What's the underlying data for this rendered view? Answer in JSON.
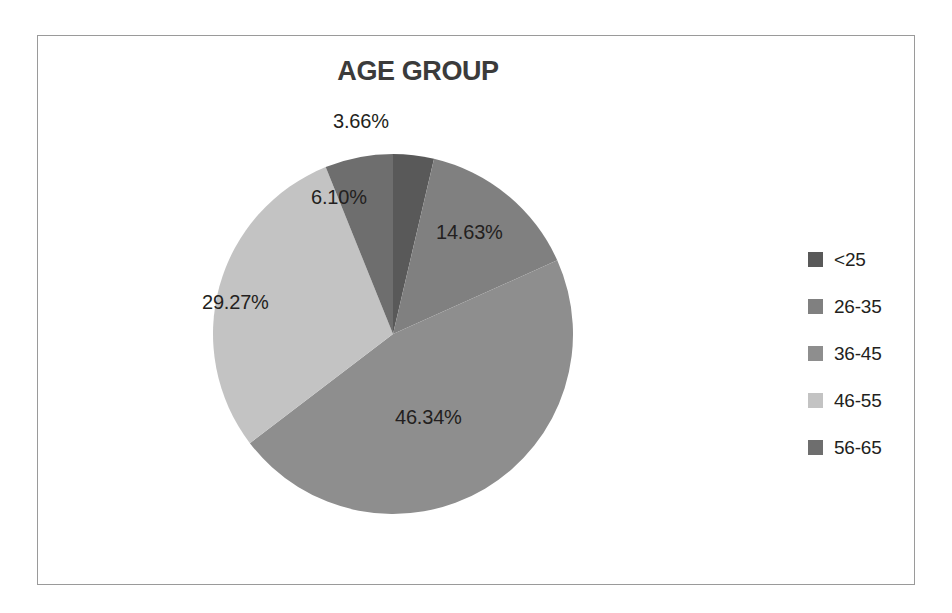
{
  "chart_data": {
    "type": "pie",
    "title": "AGE GROUP",
    "xlabel": "",
    "ylabel": "",
    "legend_position": "right",
    "grid": false,
    "categories": [
      "<25",
      "26-35",
      "36-45",
      "46-55",
      "56-65"
    ],
    "values": [
      3.66,
      14.63,
      46.34,
      29.27,
      6.1
    ],
    "value_labels": [
      "3.66%",
      "14.63%",
      "46.34%",
      "29.27%",
      "6.10%"
    ],
    "colors": [
      "#595959",
      "#808080",
      "#8e8e8e",
      "#c3c3c3",
      "#6e6e6e"
    ],
    "start_angle_deg": 0,
    "direction": "clockwise",
    "slices": [
      {
        "label": "<25",
        "value": 3.66,
        "value_label": "3.66%",
        "color": "#595959"
      },
      {
        "label": "26-35",
        "value": 14.63,
        "value_label": "14.63%",
        "color": "#808080"
      },
      {
        "label": "36-45",
        "value": 46.34,
        "value_label": "46.34%",
        "color": "#8e8e8e"
      },
      {
        "label": "46-55",
        "value": 29.27,
        "value_label": "29.27%",
        "color": "#c3c3c3"
      },
      {
        "label": "56-65",
        "value": 6.1,
        "value_label": "6.10%",
        "color": "#6e6e6e"
      }
    ]
  },
  "chart": {
    "title": "AGE GROUP",
    "labels": {
      "slice0": "3.66%",
      "slice1": "14.63%",
      "slice2": "46.34%",
      "slice3": "29.27%",
      "slice4": "6.10%"
    }
  },
  "legend": {
    "items": [
      {
        "label": "<25",
        "color": "#595959"
      },
      {
        "label": "26-35",
        "color": "#808080"
      },
      {
        "label": "36-45",
        "color": "#8e8e8e"
      },
      {
        "label": "46-55",
        "color": "#c3c3c3"
      },
      {
        "label": "56-65",
        "color": "#6e6e6e"
      }
    ]
  }
}
